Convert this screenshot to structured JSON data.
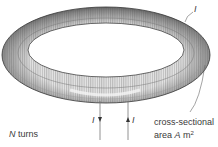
{
  "diagram": {
    "labels": {
      "current_top": "I",
      "current_in": "I",
      "current_out": "I",
      "turns_var": "N",
      "turns_text": " turns",
      "area_line1": "cross-sectional",
      "area_line2_prefix": "area ",
      "area_var": "A",
      "area_unit": " m",
      "area_exp": "2"
    },
    "colors": {
      "coil_dark": "#3a3a3a",
      "coil_mid": "#8a8a8a",
      "coil_light": "#d8d8d8",
      "background": "#ffffff"
    }
  }
}
